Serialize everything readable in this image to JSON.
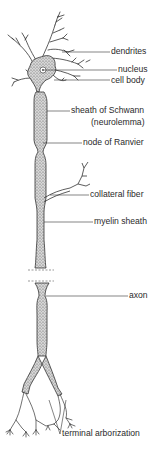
{
  "diagram": {
    "labels": {
      "dendrites": "dendrites",
      "nucleus": "nucleus",
      "cell_body": "cell body",
      "sheath_of_schwann": "sheath of Schwann",
      "neurolemma": "(neurolemma)",
      "node_of_ranvier": "node of Ranvier",
      "collateral_fiber": "collateral fiber",
      "myelin_sheath": "myelin sheath",
      "axon": "axon",
      "terminal_arborization": "terminal arborization"
    },
    "colors": {
      "line": "#333333",
      "stipple": "#777777",
      "background": "#ffffff"
    }
  }
}
